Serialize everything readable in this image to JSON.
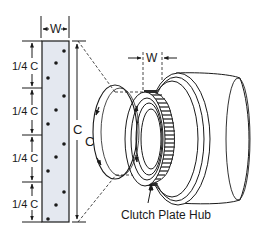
{
  "diagram": {
    "colors": {
      "stroke": "#1a1a1a",
      "strip_fill": "#e4e8f0",
      "background": "#ffffff",
      "hub_teeth": "#2a2a2a"
    },
    "strip": {
      "width_label": "W",
      "height_label": "C",
      "segment_labels": [
        "1/4 C",
        "1/4 C",
        "1/4 C",
        "1/4 C"
      ],
      "dots_per_segment": 3
    },
    "hub": {
      "width_label": "W",
      "circumference_label": "C",
      "callout_label": "Clutch Plate Hub"
    }
  }
}
